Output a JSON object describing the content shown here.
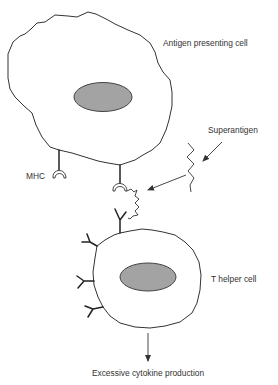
{
  "diagram": {
    "labels": {
      "apc": "Antigen presenting cell",
      "mhc": "MHC",
      "superantigen": "Superantigen",
      "t_helper": "T helper cell",
      "outcome": "Excessive cytokine production"
    },
    "colors": {
      "nucleus_fill": "#a3a3a3",
      "line": "#333333",
      "background": "#ffffff"
    },
    "components": [
      {
        "id": "apc",
        "type": "cell",
        "has_nucleus": true,
        "receptor": "MHC",
        "receptor_count": 2
      },
      {
        "id": "superantigen",
        "type": "molecule",
        "instances": [
          "free",
          "bound"
        ]
      },
      {
        "id": "t_helper",
        "type": "cell",
        "has_nucleus": true,
        "receptor": "TCR",
        "receptor_count": 4
      }
    ],
    "relations": [
      {
        "from": "superantigen",
        "to": "bound-superantigen",
        "type": "arrow"
      },
      {
        "from": "bound-superantigen",
        "to": "mhc-tcr-bridge",
        "type": "binding"
      },
      {
        "from": "t_helper",
        "to": "outcome",
        "type": "arrow"
      }
    ]
  }
}
